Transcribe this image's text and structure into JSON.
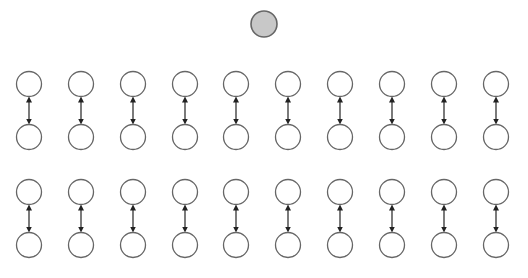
{
  "diagram": {
    "cropped_header_text": "",
    "root_node": {
      "cx": 264,
      "cy": 24,
      "r": 13,
      "fill": "#c8c8c8",
      "stroke": "#666666"
    },
    "node_style": {
      "r": 12.5,
      "fill": "#ffffff",
      "stroke": "#666666",
      "stroke_width": 1.3
    },
    "arrow_style": {
      "color": "#222222",
      "type": "bidirectional"
    },
    "columns_x": [
      29,
      81,
      133,
      185,
      236,
      288,
      340,
      392,
      444,
      496
    ],
    "rows": [
      {
        "name": "upper-row",
        "top_cy": 84,
        "bottom_cy": 137
      },
      {
        "name": "lower-row",
        "top_cy": 192,
        "bottom_cy": 245
      }
    ],
    "pair_count_per_row": 10,
    "total_pairs": 20
  }
}
